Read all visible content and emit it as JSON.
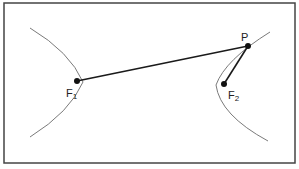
{
  "diagram": {
    "type": "hyperbola-focal-property",
    "frame": {
      "x": 4,
      "y": 3,
      "width": 291,
      "height": 160,
      "stroke": "#444444"
    },
    "curve_color": "#7a7a7a",
    "segment_color": "#1a1a1a",
    "points": {
      "F1": {
        "label": "F",
        "subscript": "1",
        "x": 77,
        "y": 81
      },
      "F2": {
        "label": "F",
        "subscript": "2",
        "x": 224,
        "y": 84
      },
      "P": {
        "label": "P",
        "x": 248,
        "y": 46
      }
    },
    "segments": [
      {
        "from": "F1",
        "to": "P"
      },
      {
        "from": "F2",
        "to": "P"
      }
    ],
    "branches": [
      {
        "name": "left-branch",
        "path": "M30,28 Q70,52 83,82 Q70,112 30,137"
      },
      {
        "name": "right-branch",
        "path": "M270,32 Q225,60 216,85 Q220,115 268,141"
      }
    ]
  }
}
